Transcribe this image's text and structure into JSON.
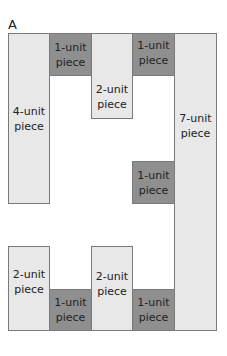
{
  "panel_label": "A",
  "colors": {
    "light": "#e8e8e8",
    "dark": "#8f8f8f",
    "border": "#7a7a7a"
  },
  "pieces": [
    {
      "units": 4,
      "label": "4-unit piece",
      "line1": "4-unit",
      "line2": "piece",
      "shade": "light"
    },
    {
      "units": 1,
      "label": "1-unit piece",
      "line1": "1-unit",
      "line2": "piece",
      "shade": "dark"
    },
    {
      "units": 2,
      "label": "2-unit piece",
      "line1": "2-unit",
      "line2": "piece",
      "shade": "light"
    },
    {
      "units": 1,
      "label": "1-unit piece",
      "line1": "1-unit",
      "line2": "piece",
      "shade": "dark"
    },
    {
      "units": 7,
      "label": "7-unit piece",
      "line1": "7-unit",
      "line2": "piece",
      "shade": "light"
    },
    {
      "units": 1,
      "label": "1-unit piece",
      "line1": "1-unit",
      "line2": "piece",
      "shade": "dark"
    },
    {
      "units": 2,
      "label": "2-unit piece",
      "line1": "2-unit",
      "line2": "piece",
      "shade": "light"
    },
    {
      "units": 1,
      "label": "1-unit piece",
      "line1": "1-unit",
      "line2": "piece",
      "shade": "dark"
    },
    {
      "units": 2,
      "label": "2-unit piece",
      "line1": "2-unit",
      "line2": "piece",
      "shade": "light"
    },
    {
      "units": 1,
      "label": "1-unit piece",
      "line1": "1-unit",
      "line2": "piece",
      "shade": "dark"
    }
  ]
}
